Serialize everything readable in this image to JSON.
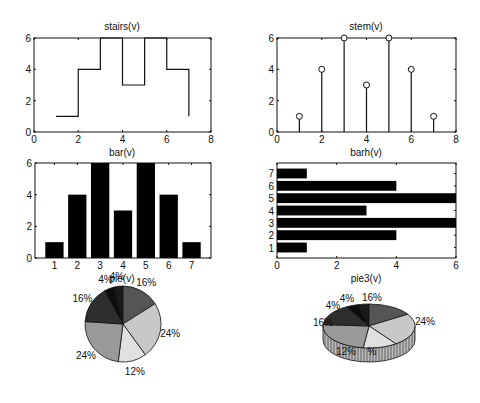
{
  "figure": {
    "width": 480,
    "height": 403,
    "background": "#ffffff"
  },
  "chart_data": [
    {
      "type": "line",
      "subtype": "stairs",
      "title": "stairs(v)",
      "x": [
        1,
        2,
        3,
        4,
        5,
        6,
        7
      ],
      "values": [
        1,
        4,
        6,
        3,
        6,
        4,
        1
      ],
      "xlim": [
        0,
        8
      ],
      "ylim": [
        0,
        6
      ],
      "xticks": [
        "0",
        "2",
        "4",
        "6",
        "8"
      ],
      "yticks": [
        "0",
        "2",
        "4",
        "6"
      ],
      "grid": false
    },
    {
      "type": "scatter",
      "subtype": "stem",
      "title": "stem(v)",
      "x": [
        1,
        2,
        3,
        4,
        5,
        6,
        7
      ],
      "values": [
        1,
        4,
        6,
        3,
        6,
        4,
        1
      ],
      "xlim": [
        0,
        8
      ],
      "ylim": [
        0,
        6
      ],
      "xticks": [
        "0",
        "2",
        "4",
        "6",
        "8"
      ],
      "yticks": [
        "0",
        "2",
        "4",
        "6"
      ],
      "marker": "circle",
      "grid": false
    },
    {
      "type": "bar",
      "title": "bar(v)",
      "categories": [
        "1",
        "2",
        "3",
        "4",
        "5",
        "6",
        "7"
      ],
      "values": [
        1,
        4,
        6,
        3,
        6,
        4,
        1
      ],
      "ylim": [
        0,
        6
      ],
      "yticks": [
        "0",
        "2",
        "4",
        "6"
      ],
      "bar_color": "#000000",
      "grid": false
    },
    {
      "type": "bar",
      "orientation": "horizontal",
      "title": "barh(v)",
      "categories": [
        "1",
        "2",
        "3",
        "4",
        "5",
        "6",
        "7"
      ],
      "values": [
        1,
        4,
        6,
        3,
        6,
        4,
        1
      ],
      "xlim": [
        0,
        6
      ],
      "xticks": [
        "0",
        "2",
        "4",
        "6"
      ],
      "bar_color": "#000000",
      "grid": false
    },
    {
      "type": "pie",
      "title": "pie(v)",
      "values": [
        1,
        4,
        6,
        3,
        6,
        4,
        1
      ],
      "labels": [
        "4%",
        "16%",
        "24%",
        "12%",
        "24%",
        "16%",
        "4%"
      ],
      "colors": [
        "#1a1a1a",
        "#555555",
        "#c8c8c8",
        "#e0e0e0",
        "#9a9a9a",
        "#2e2e2e",
        "#0d0d0d"
      ]
    },
    {
      "type": "pie",
      "subtype": "pie3",
      "title": "pie3(v)",
      "values": [
        1,
        4,
        6,
        3,
        6,
        4,
        1
      ],
      "labels": [
        "4%",
        "16%",
        "24%",
        "12%",
        "24%",
        "16%",
        "4%"
      ],
      "visible_labels": [
        "4%",
        "4%",
        "16%",
        "24%",
        "16%",
        "12%",
        "%"
      ],
      "colors": [
        "#1a1a1a",
        "#555555",
        "#c8c8c8",
        "#e0e0e0",
        "#9a9a9a",
        "#2e2e2e",
        "#0d0d0d"
      ]
    }
  ],
  "titles": {
    "stairs": "stairs(v)",
    "stem": "stem(v)",
    "bar": "bar(v)",
    "barh": "barh(v)",
    "pie": "pie(v)",
    "pie3": "pie3(v)"
  }
}
